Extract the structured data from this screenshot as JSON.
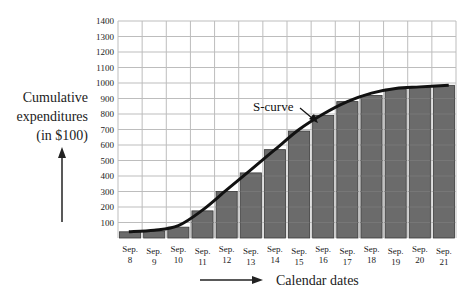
{
  "chart_data": {
    "type": "bar",
    "title": "",
    "xlabel": "Calendar dates",
    "ylabel": "Cumulative expenditures (in $100)",
    "ylabel_lines": [
      "Cumulative",
      "expenditures",
      "(in $100)"
    ],
    "categories": [
      "Sep. 8",
      "Sep. 9",
      "Sep. 10",
      "Sep. 11",
      "Sep. 12",
      "Sep. 13",
      "Sep. 14",
      "Sep. 15",
      "Sep. 16",
      "Sep. 17",
      "Sep. 18",
      "Sep. 19",
      "Sep. 20",
      "Sep. 21"
    ],
    "category_lines": [
      [
        "Sep.",
        "8"
      ],
      [
        "Sep.",
        "9"
      ],
      [
        "Sep.",
        "10"
      ],
      [
        "Sep.",
        "11"
      ],
      [
        "Sep.",
        "12"
      ],
      [
        "Sep.",
        "13"
      ],
      [
        "Sep.",
        "14"
      ],
      [
        "Sep.",
        "15"
      ],
      [
        "Sep.",
        "16"
      ],
      [
        "Sep.",
        "17"
      ],
      [
        "Sep.",
        "18"
      ],
      [
        "Sep.",
        "19"
      ],
      [
        "Sep.",
        "20"
      ],
      [
        "Sep.",
        "21"
      ]
    ],
    "values": [
      40,
      45,
      70,
      175,
      300,
      420,
      570,
      690,
      790,
      880,
      920,
      960,
      970,
      985
    ],
    "series": [
      {
        "name": "Cumulative expenditures",
        "type": "bar",
        "values": [
          40,
          45,
          70,
          175,
          300,
          420,
          570,
          690,
          790,
          880,
          920,
          960,
          970,
          985
        ]
      },
      {
        "name": "S-curve",
        "type": "line",
        "values": [
          40,
          50,
          80,
          180,
          310,
          440,
          570,
          700,
          800,
          880,
          935,
          965,
          975,
          985
        ]
      }
    ],
    "yticks": [
      100,
      200,
      300,
      400,
      500,
      600,
      700,
      800,
      900,
      1000,
      1100,
      1200,
      1300,
      1400
    ],
    "ylim": [
      0,
      1400
    ],
    "grid": true,
    "legend": "none",
    "annotations": [
      {
        "text": "S-curve",
        "points_to": "curve between Sep. 15 and Sep. 16"
      }
    ],
    "colors": {
      "bar": "#6b6b6b",
      "bar_edge": "#3a3a3a",
      "curve": "#111111",
      "grid": "#bdbdbd"
    }
  }
}
